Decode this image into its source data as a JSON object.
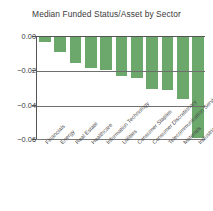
{
  "chart_data": {
    "type": "bar",
    "title": "Median Funded Status/Asset by Sector",
    "xlabel": "",
    "ylabel": "",
    "orientation": "vertical",
    "grid": true,
    "legend": null,
    "ylim": [
      -0.06,
      0.0
    ],
    "yticks": [
      "0.00",
      "-0.02",
      "-0.04",
      "-0.06"
    ],
    "ytick_values": [
      0.0,
      -0.02,
      -0.04,
      -0.06
    ],
    "bar_color": "#6ca86c",
    "axis_color": "#555555",
    "grid_color": "#6f6f6f",
    "text_color": "#3a3a3a",
    "categories": [
      "Financials",
      "Energy",
      "Real Estate",
      "Healthcare",
      "Information Technology",
      "Utilities",
      "Consumer Staples",
      "Consumer Discretionary",
      "Telecommunication Services",
      "Materials",
      "Industrials"
    ],
    "values": [
      -0.003,
      -0.009,
      -0.015,
      -0.018,
      -0.019,
      -0.023,
      -0.024,
      -0.03,
      -0.031,
      -0.036,
      -0.059
    ]
  }
}
